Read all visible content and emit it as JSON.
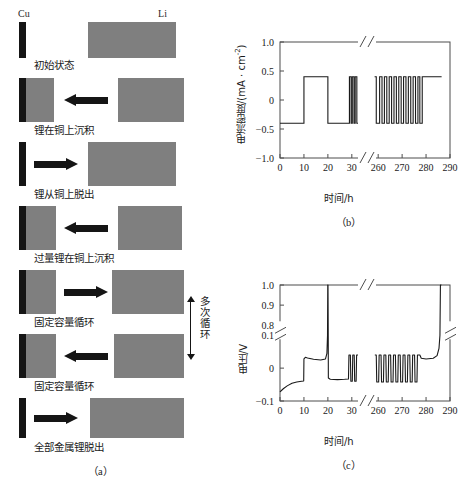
{
  "figure": {
    "panels": [
      {
        "tag": "（a）",
        "kind": "schematic"
      },
      {
        "tag": "（b）",
        "kind": "chart"
      },
      {
        "tag": "（c）",
        "kind": "chart"
      }
    ]
  },
  "panel_a": {
    "tag": "（a）",
    "electrode_labels": {
      "left": "Cu",
      "right": "Li"
    },
    "cycle_annotation": "多次循环",
    "steps": [
      {
        "caption": "初始状态",
        "arrow": "none",
        "cu_coated": false
      },
      {
        "caption": "锂在铜上沉积",
        "arrow": "left",
        "cu_coated": true
      },
      {
        "caption": "锂从铜上脱出",
        "arrow": "right",
        "cu_coated": false
      },
      {
        "caption": "过量锂在铜上沉积",
        "arrow": "left",
        "cu_coated": true
      },
      {
        "caption": "固定容量循环",
        "arrow": "right",
        "cu_coated": true
      },
      {
        "caption": "固定容量循环",
        "arrow": "left",
        "cu_coated": true
      },
      {
        "caption": "全部金属锂脱出",
        "arrow": "right",
        "cu_coated": false
      }
    ],
    "colors": {
      "cu": "#151515",
      "li": "#7f7f7f",
      "arrow": "#151515"
    }
  },
  "chart_data": [
    {
      "id": "panel-b",
      "type": "line",
      "tag": "（b）",
      "title": "",
      "xlabel": "时间/h",
      "ylabel": "电流密度/(mA · cm-2)",
      "ylabel_base": "电流密度/(mA · cm",
      "ylabel_exp": "-2",
      "ylabel_tail": ")",
      "xlim": [
        0,
        290
      ],
      "ylim": [
        -1.0,
        1.0
      ],
      "x_ticks": [
        0,
        10,
        20,
        30,
        260,
        270,
        280,
        290
      ],
      "x_tick_labels": [
        "0",
        "10",
        "20",
        "30",
        "260",
        "270",
        "280",
        "290"
      ],
      "y_ticks": [
        -1.0,
        -0.5,
        0,
        0.5,
        1.0
      ],
      "y_tick_labels": [
        "−1.0",
        "−0.5",
        "0",
        "0.5",
        "1.0"
      ],
      "axis_break": {
        "axis": "x",
        "from": 33,
        "to": 257
      },
      "grid": false,
      "legend": null,
      "series": [
        {
          "name": "current density",
          "units": "mA·cm-2",
          "high": 0.4,
          "low": -0.4,
          "segments": [
            {
              "x0": 0,
              "x1": 10,
              "y": -0.4
            },
            {
              "x0": 10,
              "x1": 20,
              "y": 0.4
            },
            {
              "x0": 20,
              "x1": 29,
              "y": -0.4
            },
            {
              "x0": 29,
              "x1": 29.7,
              "y": 0.4
            },
            {
              "x0": 29.7,
              "x1": 30.2,
              "y": -0.4
            },
            {
              "x0": 30.2,
              "x1": 30.9,
              "y": 0.4
            },
            {
              "x0": 30.9,
              "x1": 31.4,
              "y": -0.4
            },
            {
              "x0": 31.4,
              "x1": 32.1,
              "y": 0.4
            },
            {
              "x0": 32.1,
              "x1": 32.6,
              "y": -0.4
            },
            {
              "x0": 258.5,
              "x1": 259.2,
              "y": 0.4
            },
            {
              "x0": 259.2,
              "x1": 260.6,
              "y": -0.4
            },
            {
              "x0": 260.6,
              "x1": 261.6,
              "y": 0.4
            },
            {
              "x0": 261.6,
              "x1": 262.6,
              "y": -0.4
            },
            {
              "x0": 262.6,
              "x1": 263.6,
              "y": 0.4
            },
            {
              "x0": 263.6,
              "x1": 264.6,
              "y": -0.4
            },
            {
              "x0": 264.6,
              "x1": 265.6,
              "y": 0.4
            },
            {
              "x0": 265.6,
              "x1": 266.6,
              "y": -0.4
            },
            {
              "x0": 266.6,
              "x1": 267.6,
              "y": 0.4
            },
            {
              "x0": 267.6,
              "x1": 268.6,
              "y": -0.4
            },
            {
              "x0": 268.6,
              "x1": 269.6,
              "y": 0.4
            },
            {
              "x0": 269.6,
              "x1": 270.6,
              "y": -0.4
            },
            {
              "x0": 270.6,
              "x1": 271.6,
              "y": 0.4
            },
            {
              "x0": 271.6,
              "x1": 272.6,
              "y": -0.4
            },
            {
              "x0": 272.6,
              "x1": 273.6,
              "y": 0.4
            },
            {
              "x0": 273.6,
              "x1": 274.6,
              "y": -0.4
            },
            {
              "x0": 274.6,
              "x1": 275.6,
              "y": 0.4
            },
            {
              "x0": 275.6,
              "x1": 276.6,
              "y": -0.4
            },
            {
              "x0": 276.6,
              "x1": 277.4,
              "y": 0.4
            },
            {
              "x0": 277.4,
              "x1": 278.4,
              "y": -0.4
            },
            {
              "x0": 278.4,
              "x1": 286.5,
              "y": 0.4
            }
          ]
        }
      ]
    },
    {
      "id": "panel-c",
      "type": "line",
      "tag": "（c）",
      "title": "",
      "xlabel": "时间/h",
      "ylabel": "电压/V",
      "xlim": [
        0,
        290
      ],
      "ylim": [
        -0.1,
        1.0
      ],
      "x_ticks": [
        0,
        10,
        20,
        30,
        260,
        270,
        280,
        290
      ],
      "x_tick_labels": [
        "0",
        "10",
        "20",
        "30",
        "260",
        "270",
        "280",
        "290"
      ],
      "y_ticks": [
        -0.1,
        0,
        0.1,
        0.8,
        0.9,
        1.0
      ],
      "y_tick_labels": [
        "−0.1",
        "0",
        "0.1",
        "0.8",
        "0.9",
        "1.0"
      ],
      "axis_break": {
        "axis": "both",
        "x_from": 33,
        "x_to": 257,
        "y_from": 0.105,
        "y_to": 0.795
      },
      "grid": false,
      "legend": null,
      "series": [
        {
          "name": "voltage",
          "units": "V",
          "points": [
            [
              0,
              -0.072
            ],
            [
              0.6,
              -0.068
            ],
            [
              1.5,
              -0.062
            ],
            [
              3,
              -0.054
            ],
            [
              5,
              -0.046
            ],
            [
              7,
              -0.042
            ],
            [
              9,
              -0.04
            ],
            [
              9.9,
              -0.039
            ],
            [
              10.0,
              0.028
            ],
            [
              10.6,
              0.033
            ],
            [
              11.5,
              0.031
            ],
            [
              14,
              0.027
            ],
            [
              17,
              0.025
            ],
            [
              19,
              0.028
            ],
            [
              19.6,
              0.045
            ],
            [
              19.85,
              0.1
            ],
            [
              19.95,
              1.0
            ],
            [
              20.05,
              1.0
            ],
            [
              20.15,
              0.1
            ],
            [
              20.2,
              -0.03
            ],
            [
              21,
              -0.034
            ],
            [
              24,
              -0.035
            ],
            [
              27,
              -0.034
            ],
            [
              28.6,
              -0.033
            ],
            [
              28.8,
              0.04
            ],
            [
              29.4,
              0.04
            ],
            [
              29.6,
              -0.04
            ],
            [
              30.2,
              -0.04
            ],
            [
              30.4,
              0.04
            ],
            [
              31.0,
              0.04
            ],
            [
              31.2,
              -0.04
            ],
            [
              31.8,
              -0.04
            ],
            [
              32.0,
              0.04
            ],
            [
              32.6,
              0.04
            ],
            [
              258.6,
              0.04
            ],
            [
              259.2,
              0.04
            ],
            [
              259.4,
              -0.042
            ],
            [
              260.2,
              -0.042
            ],
            [
              260.4,
              0.04
            ],
            [
              261.2,
              0.04
            ],
            [
              261.4,
              -0.042
            ],
            [
              262.2,
              -0.042
            ],
            [
              262.4,
              0.04
            ],
            [
              263.2,
              0.04
            ],
            [
              263.4,
              -0.042
            ],
            [
              264.2,
              -0.042
            ],
            [
              264.4,
              0.04
            ],
            [
              265.2,
              0.04
            ],
            [
              265.4,
              -0.042
            ],
            [
              266.2,
              -0.042
            ],
            [
              266.4,
              0.04
            ],
            [
              267.2,
              0.04
            ],
            [
              267.4,
              -0.042
            ],
            [
              268.2,
              -0.042
            ],
            [
              268.4,
              0.04
            ],
            [
              269.2,
              0.04
            ],
            [
              269.4,
              -0.042
            ],
            [
              270.2,
              -0.042
            ],
            [
              270.4,
              0.04
            ],
            [
              271.2,
              0.04
            ],
            [
              271.4,
              -0.042
            ],
            [
              272.2,
              -0.042
            ],
            [
              272.4,
              0.04
            ],
            [
              273.2,
              0.04
            ],
            [
              273.4,
              -0.042
            ],
            [
              274.2,
              -0.042
            ],
            [
              274.4,
              0.04
            ],
            [
              275.2,
              0.04
            ],
            [
              275.4,
              -0.042
            ],
            [
              276.2,
              -0.042
            ],
            [
              276.4,
              0.04
            ],
            [
              277.4,
              0.04
            ],
            [
              278.0,
              0.03
            ],
            [
              280,
              0.028
            ],
            [
              283,
              0.03
            ],
            [
              284.6,
              0.038
            ],
            [
              285.4,
              0.06
            ],
            [
              285.8,
              0.1
            ],
            [
              286.0,
              1.0
            ],
            [
              286.4,
              1.0
            ]
          ]
        }
      ]
    }
  ]
}
